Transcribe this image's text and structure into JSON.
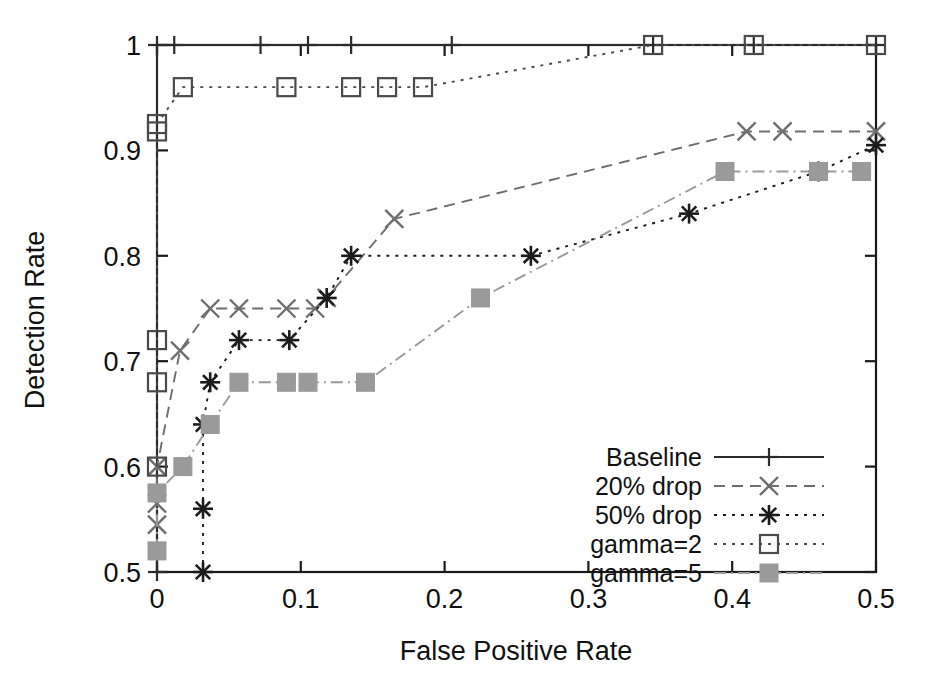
{
  "chart_data": {
    "type": "line",
    "title": "",
    "xlabel": "False Positive Rate",
    "ylabel": "Detection Rate",
    "xlim": [
      0.0,
      0.5
    ],
    "ylim": [
      0.5,
      1.0
    ],
    "xticks": [
      "0",
      "0.1",
      "0.2",
      "0.3",
      "0.4",
      "0.5"
    ],
    "xtickvalues": [
      0,
      0.1,
      0.2,
      0.3,
      0.4,
      0.5
    ],
    "yticks": [
      "0.5",
      "0.6",
      "0.7",
      "0.8",
      "0.9",
      "1"
    ],
    "ytickvalues": [
      0.5,
      0.6,
      0.7,
      0.8,
      0.9,
      1.0
    ],
    "grid": false,
    "legend_position": "lower-right",
    "series": [
      {
        "name": "Baseline",
        "marker": "plus",
        "linestyle": "solid",
        "color": "#2b2b2b",
        "x": [
          0.0,
          0.0,
          0.012,
          0.072,
          0.105,
          0.135,
          0.205,
          0.345,
          0.415,
          0.5
        ],
        "y": [
          0.5,
          1.0,
          1.0,
          1.0,
          1.0,
          1.0,
          1.0,
          1.0,
          1.0,
          1.0
        ]
      },
      {
        "name": "20% drop",
        "marker": "cross",
        "linestyle": "dashed",
        "color": "#6e6e6e",
        "x": [
          0.0,
          0.0,
          0.0,
          0.016,
          0.037,
          0.057,
          0.09,
          0.11,
          0.118,
          0.165,
          0.41,
          0.435,
          0.5
        ],
        "y": [
          0.545,
          0.565,
          0.6,
          0.71,
          0.75,
          0.75,
          0.75,
          0.75,
          0.76,
          0.835,
          0.918,
          0.918,
          0.918
        ]
      },
      {
        "name": "50% drop",
        "marker": "asterisk",
        "linestyle": "dotted",
        "color": "#1c1c1c",
        "x": [
          0.032,
          0.032,
          0.032,
          0.037,
          0.057,
          0.092,
          0.118,
          0.135,
          0.26,
          0.37,
          0.46,
          0.5
        ],
        "y": [
          0.5,
          0.56,
          0.64,
          0.68,
          0.72,
          0.72,
          0.76,
          0.8,
          0.8,
          0.84,
          0.88,
          0.905
        ]
      },
      {
        "name": "gamma=2",
        "marker": "square-open",
        "linestyle": "dotted",
        "color": "#4a4a4a",
        "x": [
          0.0,
          0.0,
          0.0,
          0.0,
          0.0,
          0.018,
          0.09,
          0.135,
          0.16,
          0.185,
          0.345,
          0.415,
          0.5
        ],
        "y": [
          0.6,
          0.68,
          0.72,
          0.918,
          0.925,
          0.96,
          0.96,
          0.96,
          0.96,
          0.96,
          1.0,
          1.0,
          1.0
        ]
      },
      {
        "name": "gamma=5",
        "marker": "square-filled",
        "linestyle": "dashdot",
        "color": "#9a9a9a",
        "x": [
          0.0,
          0.0,
          0.018,
          0.037,
          0.057,
          0.09,
          0.105,
          0.145,
          0.225,
          0.395,
          0.46,
          0.49
        ],
        "y": [
          0.52,
          0.575,
          0.6,
          0.64,
          0.68,
          0.68,
          0.68,
          0.68,
          0.76,
          0.88,
          0.88,
          0.88
        ]
      }
    ]
  },
  "axes": {
    "x_title": "False Positive Rate",
    "y_title": "Detection Rate",
    "x_tick_labels": [
      "0",
      "0.1",
      "0.2",
      "0.3",
      "0.4",
      "0.5"
    ],
    "y_tick_labels": [
      "0.5",
      "0.6",
      "0.7",
      "0.8",
      "0.9",
      "1"
    ]
  },
  "legend": {
    "entries": [
      {
        "label": "Baseline",
        "marker": "plus-icon",
        "linestyle": "solid"
      },
      {
        "label": "20% drop",
        "marker": "cross-icon",
        "linestyle": "dashed"
      },
      {
        "label": "50% drop",
        "marker": "asterisk-icon",
        "linestyle": "dotted"
      },
      {
        "label": "gamma=2",
        "marker": "open-square-icon",
        "linestyle": "dotted"
      },
      {
        "label": "gamma=5",
        "marker": "filled-square-icon",
        "linestyle": "dashdot"
      }
    ]
  },
  "colors": {
    "baseline": "#2b2b2b",
    "drop20": "#6e6e6e",
    "drop50": "#1c1c1c",
    "gamma2": "#4a4a4a",
    "gamma5": "#9a9a9a",
    "axis": "#1a1a1a",
    "background": "#ffffff"
  }
}
